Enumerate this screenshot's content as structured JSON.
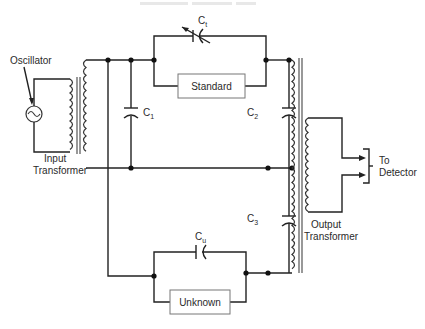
{
  "diagram": {
    "type": "circuit-schematic",
    "colors": {
      "wire": "#222222",
      "box_border": "#777777",
      "background": "#ffffff"
    },
    "labels": {
      "oscillator": "Oscillator",
      "input_transformer_line1": "Input",
      "input_transformer_line2": "Transformer",
      "output_transformer_line1": "Output",
      "output_transformer_line2": "Transformer",
      "standard": "Standard",
      "unknown": "Unknown",
      "detector_line1": "To",
      "detector_line2": "Detector"
    },
    "capacitors": {
      "ct": {
        "base": "C",
        "sub": "t",
        "kind": "variable"
      },
      "c1": {
        "base": "C",
        "sub": "1",
        "kind": "fixed"
      },
      "c2": {
        "base": "C",
        "sub": "2",
        "kind": "fixed"
      },
      "c3": {
        "base": "C",
        "sub": "3",
        "kind": "fixed"
      },
      "cu": {
        "base": "C",
        "sub": "u",
        "kind": "fixed"
      }
    },
    "components": [
      {
        "id": "oscillator",
        "label": "Oscillator",
        "symbol": "ac-source"
      },
      {
        "id": "input-transformer",
        "label": "Input Transformer"
      },
      {
        "id": "output-transformer",
        "label": "Output Transformer",
        "note": "center-tapped primary"
      },
      {
        "id": "standard",
        "label": "Standard",
        "parallel_with": "Ct"
      },
      {
        "id": "unknown",
        "label": "Unknown",
        "parallel_with": "Cu"
      },
      {
        "id": "C1",
        "label": "C1"
      },
      {
        "id": "C2",
        "label": "C2"
      },
      {
        "id": "C3",
        "label": "C3"
      },
      {
        "id": "Ct",
        "label": "Ct",
        "variable": true
      },
      {
        "id": "Cu",
        "label": "Cu"
      },
      {
        "id": "detector",
        "label": "To Detector"
      }
    ]
  }
}
